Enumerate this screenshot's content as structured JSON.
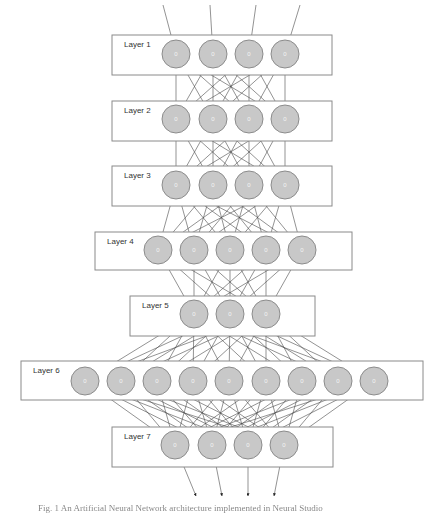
{
  "diagram": {
    "type": "neural-network",
    "node_value": "0",
    "colors": {
      "node_fill": "#c8c8c8",
      "node_stroke": "#8c8c8c",
      "box_stroke": "#8a8a8a",
      "edge": "#4a4a4a"
    },
    "input_arrows": 4,
    "output_arrows": 4,
    "layers": [
      {
        "label": "Layer 1",
        "nodes": 4,
        "box": [
          112,
          35,
          220,
          40
        ],
        "cy": 54,
        "xs": [
          176,
          213,
          249,
          285
        ]
      },
      {
        "label": "Layer 2",
        "nodes": 4,
        "box": [
          112,
          101,
          220,
          40
        ],
        "cy": 119,
        "xs": [
          176,
          213,
          249,
          285
        ]
      },
      {
        "label": "Layer 3",
        "nodes": 4,
        "box": [
          112,
          166,
          220,
          40
        ],
        "cy": 185,
        "xs": [
          176,
          213,
          249,
          285
        ]
      },
      {
        "label": "Layer 4",
        "nodes": 5,
        "box": [
          95,
          232,
          257,
          38
        ],
        "cy": 250,
        "xs": [
          158,
          194,
          230,
          266,
          302
        ]
      },
      {
        "label": "Layer 5",
        "nodes": 3,
        "box": [
          130,
          296,
          185,
          40
        ],
        "cy": 314,
        "xs": [
          194,
          230,
          266
        ]
      },
      {
        "label": "Layer 6",
        "nodes": 9,
        "box": [
          21,
          361,
          402,
          39
        ],
        "cy": 381,
        "xs": [
          85,
          121,
          157,
          193,
          229,
          266,
          302,
          338,
          374
        ]
      },
      {
        "label": "Layer 7",
        "nodes": 4,
        "box": [
          112,
          427,
          221,
          40
        ],
        "cy": 445,
        "xs": [
          175,
          212,
          248,
          284
        ]
      }
    ],
    "caption": "Fig. 1 An Artificial Neural Network architecture implemented in Neural Studio"
  }
}
